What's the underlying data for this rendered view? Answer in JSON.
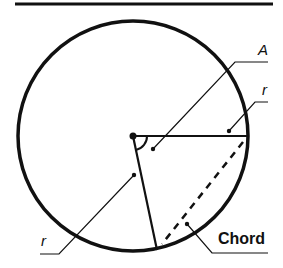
{
  "diagram": {
    "title_rule": true,
    "labels": {
      "angle": "A",
      "radius_top": "r",
      "radius_bottom": "r",
      "chord": "Chord"
    },
    "colors": {
      "stroke": "#111111",
      "background": "#ffffff"
    }
  }
}
